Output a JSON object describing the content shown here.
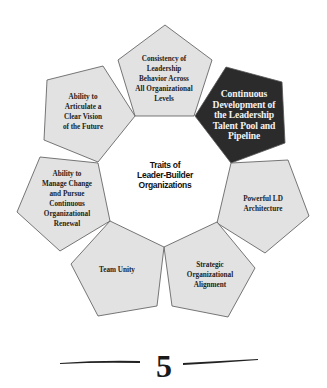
{
  "diagram": {
    "center_title": [
      "Traits of",
      "Leader-Builder",
      "Organizations"
    ],
    "colors": {
      "light_fill": "#e2e2e2",
      "dark_fill": "#2b2b2b",
      "stroke": "#555555",
      "light_text": "#222222",
      "dark_text": "#f2f2f2"
    },
    "traits": [
      {
        "id": "consistency",
        "lines": [
          "Consistency of",
          "Leadership",
          "Behavior Across",
          "All Organizational",
          "Levels"
        ],
        "highlighted": false
      },
      {
        "id": "continuous-development",
        "lines": [
          "Continuous",
          "Development of",
          "the Leadership",
          "Talent Pool and",
          "Pipeline"
        ],
        "highlighted": true
      },
      {
        "id": "powerful-ld",
        "lines": [
          "Powerful LD",
          "Architecture"
        ],
        "highlighted": false
      },
      {
        "id": "strategic-alignment",
        "lines": [
          "Strategic",
          "Organizational",
          "Alignment"
        ],
        "highlighted": false
      },
      {
        "id": "team-unity",
        "lines": [
          "Team Unity"
        ],
        "highlighted": false
      },
      {
        "id": "manage-change",
        "lines": [
          "Ability to",
          "Manage Change",
          "and Pursue",
          "Continuous",
          "Organizational",
          "Renewal"
        ],
        "highlighted": false
      },
      {
        "id": "clear-vision",
        "lines": [
          "Ability to",
          "Articulate a",
          "Clear Vision",
          "of the Future"
        ],
        "highlighted": false
      }
    ]
  },
  "footer": {
    "page_number": "5"
  }
}
